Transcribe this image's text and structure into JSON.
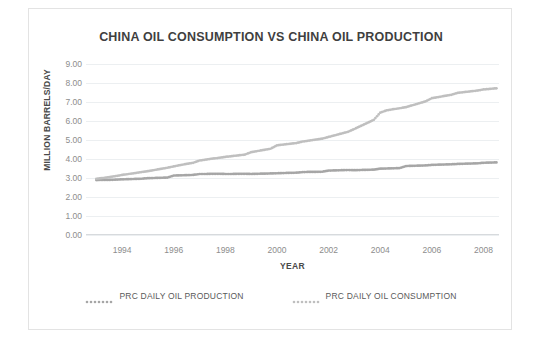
{
  "chart_data": {
    "type": "scatter",
    "title": "CHINA OIL CONSUMPTION VS CHINA OIL PRODUCTION",
    "xlabel": "YEAR",
    "ylabel": "MILLION BARRELS/DAY",
    "xlim": [
      1992.6,
      2008.6
    ],
    "ylim": [
      0.0,
      9.0
    ],
    "grid": true,
    "legend_position": "bottom",
    "y_ticks": [
      "0.00",
      "1.00",
      "2.00",
      "3.00",
      "4.00",
      "5.00",
      "6.00",
      "7.00",
      "8.00",
      "9.00"
    ],
    "y_tick_values": [
      0,
      1,
      2,
      3,
      4,
      5,
      6,
      7,
      8,
      9
    ],
    "x_ticks": [
      "1994",
      "1996",
      "1998",
      "2000",
      "2002",
      "2004",
      "2006",
      "2008"
    ],
    "x_tick_values": [
      1994,
      1996,
      1998,
      2000,
      2002,
      2004,
      2006,
      2008
    ],
    "colors": {
      "production": "#a6a6a6",
      "consumption": "#bfbfbf",
      "grid": "#eceff1",
      "text": "#4a4a4a",
      "tick_text": "#8d8d8d"
    },
    "x": [
      1993.0,
      1993.25,
      1993.5,
      1993.75,
      1994.0,
      1994.25,
      1994.5,
      1994.75,
      1995.0,
      1995.25,
      1995.5,
      1995.75,
      1996.0,
      1996.25,
      1996.5,
      1996.75,
      1997.0,
      1997.25,
      1997.5,
      1997.75,
      1998.0,
      1998.25,
      1998.5,
      1998.75,
      1999.0,
      1999.25,
      1999.5,
      1999.75,
      2000.0,
      2000.25,
      2000.5,
      2000.75,
      2001.0,
      2001.25,
      2001.5,
      2001.75,
      2002.0,
      2002.25,
      2002.5,
      2002.75,
      2003.0,
      2003.25,
      2003.5,
      2003.75,
      2004.0,
      2004.25,
      2004.5,
      2004.75,
      2005.0,
      2005.25,
      2005.5,
      2005.75,
      2006.0,
      2006.25,
      2006.5,
      2006.75,
      2007.0,
      2007.25,
      2007.5,
      2007.75,
      2008.0,
      2008.25,
      2008.5
    ],
    "series": [
      {
        "name": "PRC DAILY OIL PRODUCTION",
        "color": "#a6a6a6",
        "marker": "dotted",
        "values": [
          2.89,
          2.9,
          2.9,
          2.91,
          2.93,
          2.94,
          2.95,
          2.96,
          2.99,
          3.0,
          3.01,
          3.02,
          3.13,
          3.14,
          3.15,
          3.16,
          3.21,
          3.21,
          3.22,
          3.22,
          3.21,
          3.21,
          3.22,
          3.22,
          3.21,
          3.22,
          3.23,
          3.24,
          3.25,
          3.26,
          3.27,
          3.28,
          3.31,
          3.32,
          3.32,
          3.33,
          3.39,
          3.4,
          3.41,
          3.42,
          3.41,
          3.42,
          3.43,
          3.44,
          3.49,
          3.5,
          3.51,
          3.52,
          3.63,
          3.64,
          3.65,
          3.66,
          3.69,
          3.7,
          3.71,
          3.72,
          3.74,
          3.75,
          3.76,
          3.77,
          3.8,
          3.81,
          3.82
        ]
      },
      {
        "name": "PRC DAILY OIL CONSUMPTION",
        "color": "#bfbfbf",
        "marker": "dotted",
        "values": [
          2.96,
          3.0,
          3.05,
          3.1,
          3.16,
          3.21,
          3.26,
          3.31,
          3.36,
          3.42,
          3.48,
          3.54,
          3.61,
          3.68,
          3.74,
          3.8,
          3.92,
          3.97,
          4.02,
          4.06,
          4.11,
          4.15,
          4.19,
          4.23,
          4.36,
          4.42,
          4.48,
          4.54,
          4.72,
          4.76,
          4.8,
          4.84,
          4.92,
          4.97,
          5.02,
          5.07,
          5.16,
          5.25,
          5.34,
          5.43,
          5.58,
          5.74,
          5.9,
          6.06,
          6.44,
          6.56,
          6.62,
          6.67,
          6.73,
          6.83,
          6.93,
          7.03,
          7.2,
          7.26,
          7.32,
          7.38,
          7.48,
          7.52,
          7.56,
          7.6,
          7.66,
          7.69,
          7.72
        ]
      }
    ]
  },
  "legend": {
    "entries": [
      {
        "label": "PRC DAILY OIL PRODUCTION"
      },
      {
        "label": "PRC DAILY OIL CONSUMPTION"
      }
    ]
  }
}
